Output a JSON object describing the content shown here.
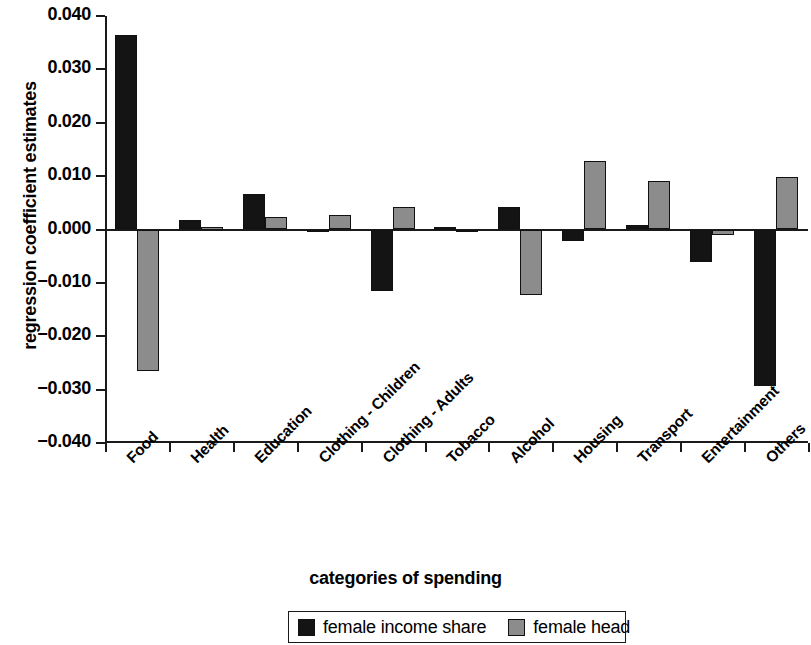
{
  "chart_data": {
    "type": "bar",
    "title": "",
    "xlabel": "categories of spending",
    "ylabel": "regression coefficient estimates",
    "ylim": [
      -0.04,
      0.04
    ],
    "yticks": [
      "0.040",
      "0.030",
      "0.020",
      "0.010",
      "0.000",
      "−0.010",
      "−0.020",
      "−0.030",
      "−0.040"
    ],
    "ytick_values": [
      0.04,
      0.03,
      0.02,
      0.01,
      0.0,
      -0.01,
      -0.02,
      -0.03,
      -0.04
    ],
    "grid": false,
    "legend_position": "bottom",
    "categories": [
      "Food",
      "Health",
      "Education",
      "Clothing - Children",
      "Clothing - Adults",
      "Tobacco",
      "Alcohol",
      "Housing",
      "Transport",
      "Entertainment",
      "Others"
    ],
    "series": [
      {
        "name": "female income share",
        "color": "#141414",
        "values": [
          0.0365,
          0.0018,
          0.0067,
          -0.0004,
          -0.0115,
          0.0004,
          0.0042,
          -0.0022,
          0.0008,
          -0.006,
          -0.0293
        ]
      },
      {
        "name": "female head",
        "color": "#8c8c8c",
        "values": [
          -0.0265,
          0.0003,
          0.0023,
          0.0028,
          0.0042,
          -0.0004,
          -0.0122,
          0.0129,
          0.009,
          -0.001,
          0.0098
        ]
      }
    ]
  },
  "colors": {
    "series_black": "#141414",
    "series_gray": "#8c8c8c",
    "axis": "#1a1a1a",
    "background": "#ffffff"
  }
}
